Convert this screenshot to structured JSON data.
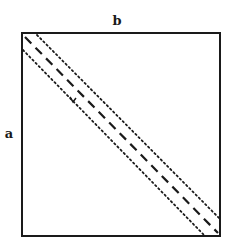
{
  "diagram": {
    "labels": {
      "top": "b",
      "left": "a"
    },
    "colors": {
      "ink": "#1a1a1a",
      "background": "#ffffff"
    },
    "frame": {
      "x": 22,
      "y": 33,
      "width": 198,
      "height": 203
    },
    "lines": [
      {
        "name": "main-diagonal",
        "style": "dashed"
      },
      {
        "name": "upper-band",
        "style": "dotted"
      },
      {
        "name": "lower-band",
        "style": "dotted"
      }
    ],
    "marker": "v"
  }
}
